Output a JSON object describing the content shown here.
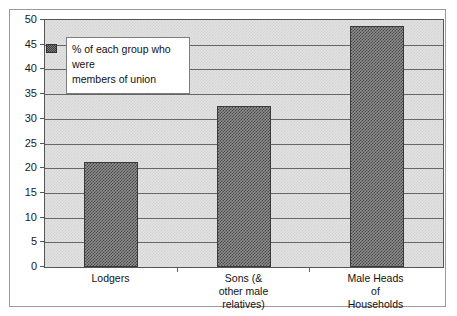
{
  "clipped_top_text": "",
  "chart_data": {
    "type": "bar",
    "title": "",
    "xlabel": "",
    "ylabel": "",
    "categories": [
      "Lodgers",
      "Sons (&\nother male\nrelatives)",
      "Male Heads\nof\nHouseholds"
    ],
    "category_lines": [
      [
        "Lodgers"
      ],
      [
        "Sons (&",
        "other male",
        "relatives)"
      ],
      [
        "Male Heads",
        "of",
        "Households"
      ]
    ],
    "values": [
      21.2,
      32.5,
      48.7
    ],
    "series": [
      {
        "name": "% of each group who were members of union",
        "values": [
          21.2,
          32.5,
          48.7
        ]
      }
    ],
    "ylim": [
      0,
      50
    ],
    "ytick_step": 5,
    "yticks": [
      0,
      5,
      10,
      15,
      20,
      25,
      30,
      35,
      40,
      45,
      50
    ],
    "ytick_labels": [
      "0",
      "5",
      "10",
      "15",
      "20",
      "25",
      "30",
      "35",
      "40",
      "45",
      "50"
    ],
    "grid": true,
    "legend_position": "upper-left",
    "colors": {
      "bar_fill": "#8d8d8d",
      "bar_pattern": "#4a4a4a",
      "bar_border": "#3a3a3a",
      "plot_background": "#e3e3e3",
      "gridline": "#666666",
      "axis": "#555555",
      "frame_border": "#9a9a9a",
      "legend_background": "#ffffff",
      "text": "#111111"
    }
  },
  "legend": {
    "line1": "% of each group who were",
    "line2": "members of union",
    "swatch_name": "series-color-swatch"
  }
}
